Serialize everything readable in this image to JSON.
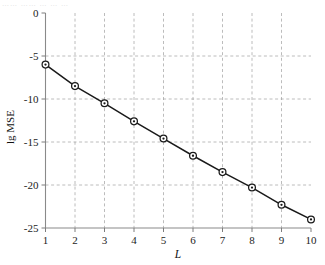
{
  "figure": {
    "scan_artifact_text": "……  ……  … … …",
    "background_color": "#ffffff",
    "line_color": "#1a1a1a",
    "grid_color": "#9a9a9a",
    "axis_color": "#8a8a8a"
  },
  "chart_data": {
    "type": "line",
    "title": "",
    "subtitle": "",
    "xlabel": "L",
    "ylabel": "lg MSE",
    "x": [
      1,
      2,
      3,
      4,
      5,
      6,
      7,
      8,
      9,
      10
    ],
    "series": [
      {
        "name": "lgMSE",
        "values": [
          -6.0,
          -8.5,
          -10.5,
          -12.6,
          -14.6,
          -16.6,
          -18.5,
          -20.3,
          -22.3,
          -24.0
        ],
        "marker": "circle-dot",
        "color": "#1a1a1a"
      }
    ],
    "xlim": [
      1,
      10
    ],
    "ylim": [
      -25,
      0
    ],
    "xticks": [
      1,
      2,
      3,
      4,
      5,
      6,
      7,
      8,
      9,
      10
    ],
    "xtick_labels": [
      "1",
      "2",
      "3",
      "4",
      "5",
      "6",
      "7",
      "8",
      "9",
      "10"
    ],
    "yticks": [
      0,
      -5,
      -10,
      -15,
      -20,
      -25
    ],
    "ytick_labels": [
      "0",
      "-5",
      "-10",
      "-15",
      "-20",
      "-25"
    ],
    "grid": true,
    "grid_style": "dashed",
    "gridlines_x": [
      2,
      3,
      4,
      5,
      6,
      7,
      8,
      9
    ],
    "gridlines_y": [
      -5,
      -10,
      -15,
      -20
    ],
    "legend": null,
    "legend_position": "none",
    "annotations": []
  }
}
